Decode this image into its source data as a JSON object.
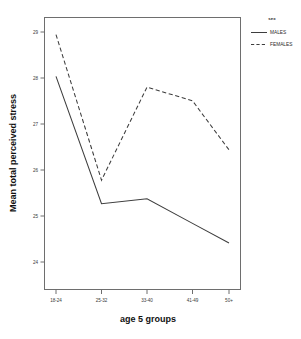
{
  "chart_data": {
    "type": "line",
    "title": "",
    "xlabel": "age 5 groups",
    "ylabel": "Mean total perceived stress",
    "categories": [
      "18-24",
      "25-32",
      "33-40",
      "41-49",
      "50+"
    ],
    "series": [
      {
        "name": "MALES",
        "style": "solid",
        "values": [
          28.1,
          25.5,
          25.6,
          25.1,
          24.7
        ]
      },
      {
        "name": "FEMALES",
        "style": "dashed",
        "values": [
          28.95,
          25.98,
          27.88,
          27.6,
          26.6
        ]
      }
    ],
    "ylim": [
      23.75,
      29.3
    ],
    "yticks": [
      24,
      25,
      26,
      27,
      28,
      29
    ],
    "ytick_labels": [
      "24",
      "25",
      "26",
      "27",
      "28",
      "29"
    ],
    "grid": false,
    "legend": {
      "title": "sex",
      "position": "right-top",
      "entries": [
        {
          "label": "MALES",
          "style": "solid"
        },
        {
          "label": "FEMALES",
          "style": "dashed"
        }
      ]
    }
  },
  "axes": {
    "x_title": "age 5 groups",
    "y_title": "Mean total perceived stress"
  },
  "legend": {
    "title": "sex",
    "males_label": "MALES",
    "females_label": "FEMALES"
  },
  "ticks": {
    "y": [
      "29",
      "28",
      "27",
      "26",
      "25",
      "24"
    ],
    "x": [
      "18-24",
      "25-32",
      "33-40",
      "41-49",
      "50+"
    ]
  },
  "colors": {
    "line": "#3d3d3d",
    "axis": "#6e6e6e",
    "text": "#2b2b2b",
    "background": "#ffffff"
  }
}
